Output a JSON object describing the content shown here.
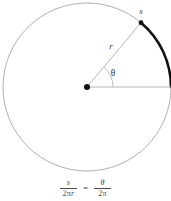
{
  "figure": {
    "type": "geometry-diagram",
    "labels": {
      "arc_label": "s",
      "radius_label": "r",
      "angle_label": "θ"
    },
    "colors": {
      "circle_outline": "#9a9a9a",
      "arc_highlight": "#111111",
      "radius_line": "#aaaaaa",
      "baseline_line": "#aaaaaa",
      "center_dot": "#111111",
      "text": "#3a3a3a",
      "background": "#ffffff"
    },
    "geometry": {
      "center_x": 87,
      "center_y": 87,
      "radius_px": 84,
      "angle_degrees": 50,
      "arc_start_degrees": 50,
      "arc_end_degrees": 0
    }
  },
  "formula": {
    "left": {
      "numerator": "s",
      "denominator_coefficient": "2π",
      "denominator_variable": "r"
    },
    "equals": "=",
    "right": {
      "numerator": "θ",
      "denominator_coefficient": "2π",
      "denominator_variable": ""
    }
  }
}
